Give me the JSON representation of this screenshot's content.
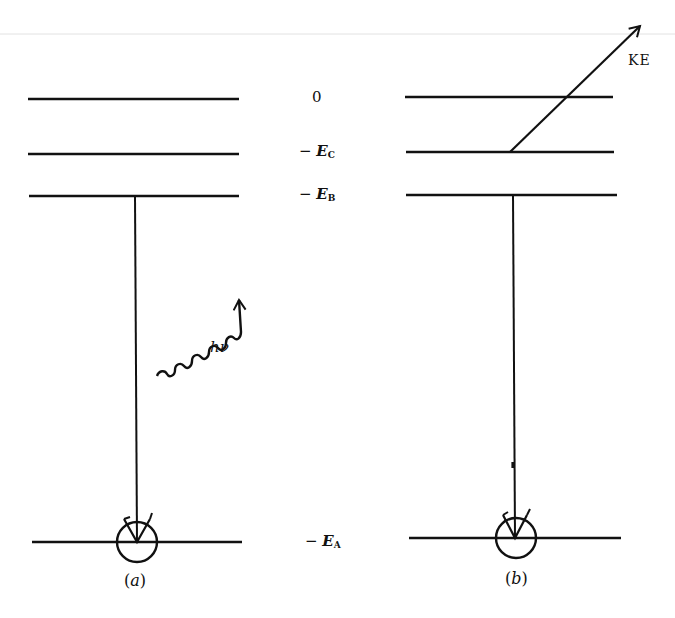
{
  "diagram": {
    "type": "energy-level diagram",
    "energy_labels": {
      "zero": "0",
      "ec": {
        "minus": "−",
        "symbol": "E",
        "sub": "C"
      },
      "eb": {
        "minus": "−",
        "symbol": "E",
        "sub": "B"
      },
      "ea": {
        "minus": "−",
        "symbol": "E",
        "sub": "A"
      }
    },
    "panels": [
      {
        "id": "a",
        "label_open": "(",
        "label_letter": "a",
        "label_close": ")",
        "photon_label": "hν",
        "description": "Electron B drops to vacancy in level A, emitting photon hν"
      },
      {
        "id": "b",
        "label_open": "(",
        "label_letter": "b",
        "label_close": ")",
        "ejected_label": "KE",
        "description": "Energy transferred to electron C, which is ejected with kinetic energy KE"
      }
    ],
    "colors": {
      "line": "#111111",
      "background": "#ffffff",
      "top_rule": "#dddddd"
    }
  }
}
